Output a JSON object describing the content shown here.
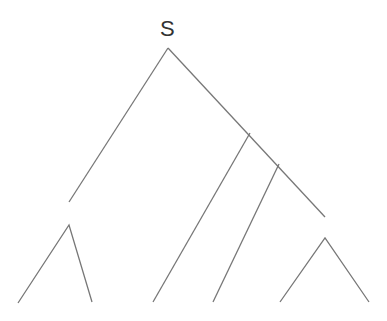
{
  "diagram": {
    "type": "syntax-tree",
    "root_label": "S",
    "stroke_color": "#777777",
    "nodes": [
      {
        "id": "S",
        "label": "S",
        "x": 168,
        "y": 48
      },
      {
        "id": "j1",
        "label": "",
        "x": 250,
        "y": 133
      },
      {
        "id": "j2",
        "label": "",
        "x": 279,
        "y": 164
      },
      {
        "id": "left_end",
        "label": "",
        "x": 69,
        "y": 202
      },
      {
        "id": "right_end",
        "label": "",
        "x": 325,
        "y": 217
      }
    ],
    "edges": [
      {
        "from": [
          168,
          48
        ],
        "to": [
          69,
          202
        ]
      },
      {
        "from": [
          168,
          48
        ],
        "to": [
          325,
          217
        ]
      },
      {
        "from": [
          250,
          133
        ],
        "to": [
          153,
          302
        ]
      },
      {
        "from": [
          279,
          164
        ],
        "to": [
          213,
          302
        ]
      }
    ],
    "triangles": [
      {
        "apex": [
          69,
          225
        ],
        "left": [
          18,
          303
        ],
        "right": [
          92,
          302
        ]
      },
      {
        "apex": [
          325,
          238
        ],
        "left": [
          280,
          302
        ],
        "right": [
          369,
          302
        ]
      }
    ]
  }
}
